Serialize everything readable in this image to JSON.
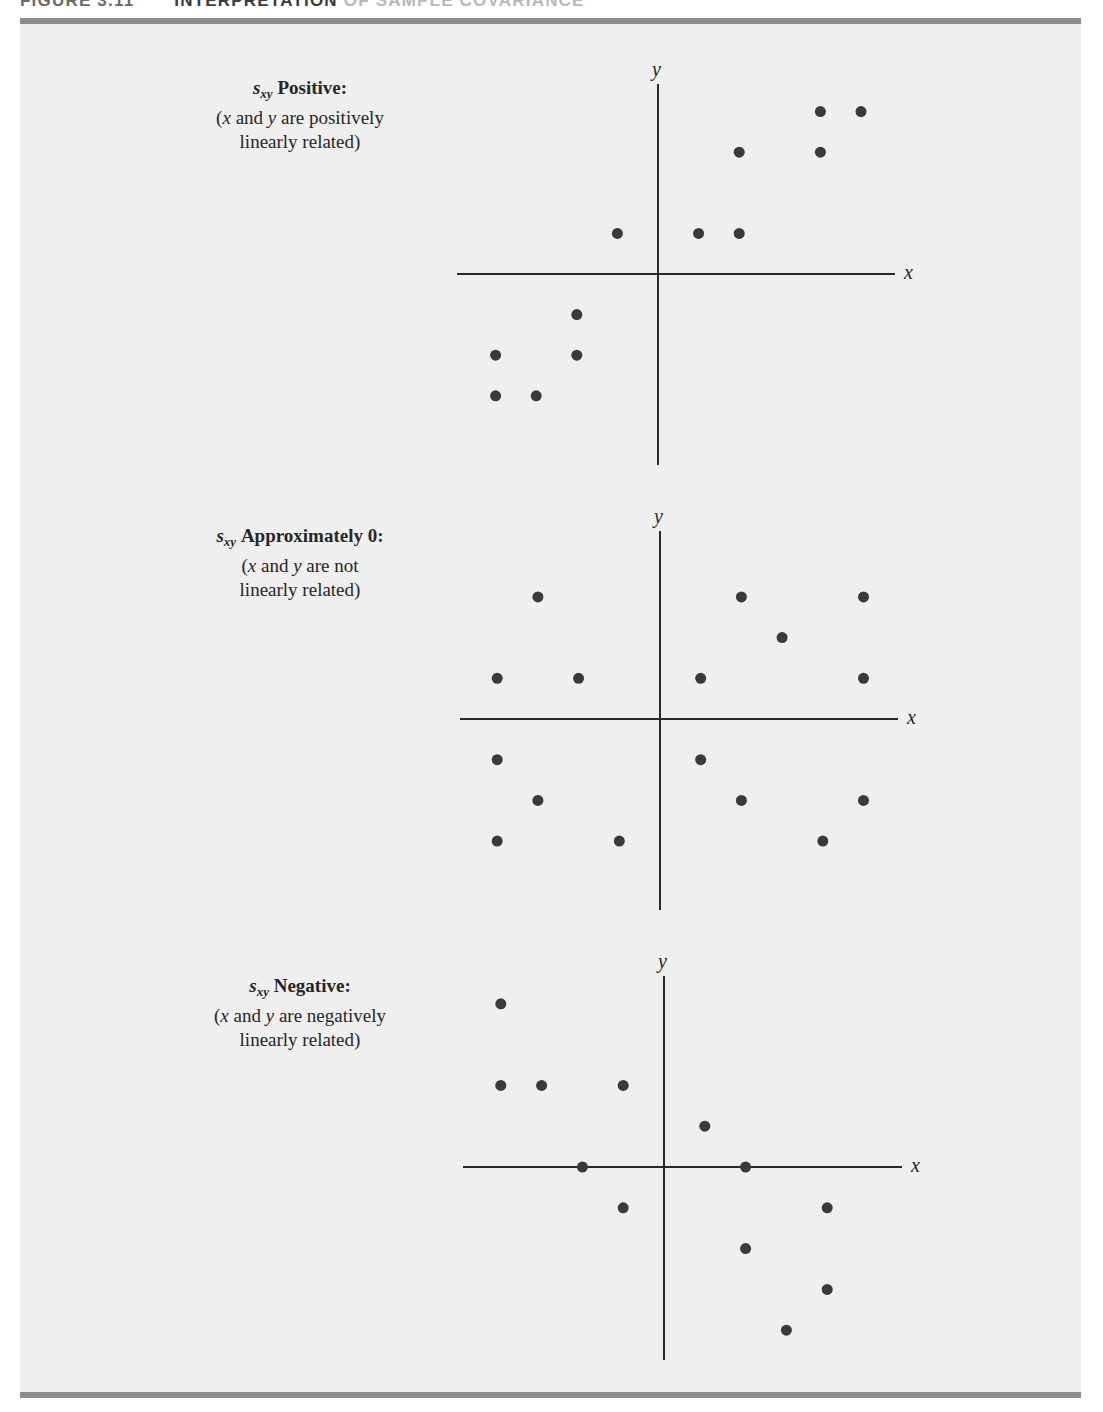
{
  "figure": {
    "number": "FIGURE 3.11",
    "title_main": "INTERPRETATION",
    "title_rest": " OF SAMPLE COVARIANCE",
    "colors": {
      "page_background": "#ffffff",
      "panel_background": "#efefef",
      "rule": "#8c8c8c",
      "axis": "#2a2a2a",
      "point": "#3a3a3a",
      "text": "#262626"
    }
  },
  "panels": [
    {
      "id": "positive",
      "label": {
        "symbol": "s",
        "subscript": "xy",
        "heading": "Positive:",
        "line2_open": "(",
        "line2_x": "x",
        "line2_mid": " and ",
        "line2_y": "y",
        "line2_end": " are positively",
        "line3": "linearly related)"
      },
      "axes": {
        "x_label": "x",
        "y_label": "y"
      }
    },
    {
      "id": "approximately-zero",
      "label": {
        "symbol": "s",
        "subscript": "xy",
        "heading": "Approximately 0:",
        "line2_open": "(",
        "line2_x": "x",
        "line2_mid": " and ",
        "line2_y": "y",
        "line2_end": " are not",
        "line3": "linearly related)"
      },
      "axes": {
        "x_label": "x",
        "y_label": "y"
      }
    },
    {
      "id": "negative",
      "label": {
        "symbol": "s",
        "subscript": "xy",
        "heading": "Negative:",
        "line2_open": "(",
        "line2_x": "x",
        "line2_mid": " and ",
        "line2_y": "y",
        "line2_end": " are negatively",
        "line3": "linearly related)"
      },
      "axes": {
        "x_label": "x",
        "y_label": "y"
      }
    }
  ],
  "chart_data": [
    {
      "type": "scatter",
      "title": "s_xy Positive: (x and y are positively linearly related)",
      "xlabel": "x",
      "ylabel": "y",
      "grid": false,
      "axes_through_origin": true,
      "xlim": [
        -5,
        6
      ],
      "ylim": [
        -5,
        5
      ],
      "points": [
        [
          4,
          4
        ],
        [
          5,
          4
        ],
        [
          2,
          3
        ],
        [
          4,
          3
        ],
        [
          -1,
          1
        ],
        [
          1,
          1
        ],
        [
          2,
          1
        ],
        [
          -2,
          -1
        ],
        [
          -4,
          -2
        ],
        [
          -2,
          -2
        ],
        [
          -4,
          -3
        ],
        [
          -3,
          -3
        ]
      ]
    },
    {
      "type": "scatter",
      "title": "s_xy Approximately 0: (x and y are not linearly related)",
      "xlabel": "x",
      "ylabel": "y",
      "grid": false,
      "axes_through_origin": true,
      "xlim": [
        -5,
        6
      ],
      "ylim": [
        -5,
        5
      ],
      "points": [
        [
          -3,
          3
        ],
        [
          2,
          3
        ],
        [
          5,
          3
        ],
        [
          3,
          2
        ],
        [
          -4,
          1
        ],
        [
          -2,
          1
        ],
        [
          1,
          1
        ],
        [
          5,
          1
        ],
        [
          -4,
          -1
        ],
        [
          1,
          -1
        ],
        [
          -3,
          -2
        ],
        [
          2,
          -2
        ],
        [
          5,
          -2
        ],
        [
          -4,
          -3
        ],
        [
          -1,
          -3
        ],
        [
          4,
          -3
        ]
      ]
    },
    {
      "type": "scatter",
      "title": "s_xy Negative: (x and y are negatively linearly related)",
      "xlabel": "x",
      "ylabel": "y",
      "grid": false,
      "axes_through_origin": true,
      "xlim": [
        -5,
        6
      ],
      "ylim": [
        -5,
        5
      ],
      "points": [
        [
          -4,
          4
        ],
        [
          -4,
          2
        ],
        [
          -3,
          2
        ],
        [
          -1,
          2
        ],
        [
          1,
          1
        ],
        [
          -2,
          0
        ],
        [
          2,
          0
        ],
        [
          -1,
          -1
        ],
        [
          4,
          -1
        ],
        [
          2,
          -2
        ],
        [
          4,
          -3
        ],
        [
          3,
          -4
        ]
      ]
    }
  ]
}
